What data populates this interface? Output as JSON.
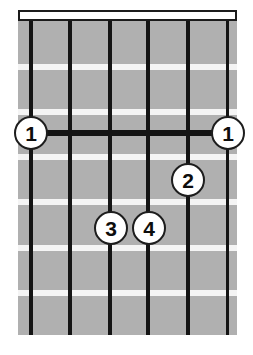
{
  "diagram": {
    "type": "guitar-chord-diagram",
    "orientation": "vertical",
    "string_count": 6,
    "fret_count": 7,
    "colors": {
      "background": "#ffffff",
      "fretboard": "#b0b0b0",
      "fret_line": "#f4f4f4",
      "string_line": "#141414",
      "nut_fill": "#fdfdfd",
      "nut_border": "#1a1a1a",
      "marker_fill": "#ffffff",
      "marker_border": "#1d1d1d",
      "marker_text": "#0d0d0d",
      "barre": "#141414"
    },
    "board": {
      "x": 18,
      "y": 10,
      "width": 219,
      "height": 325
    },
    "nut": {
      "x": 18,
      "y": 10,
      "width": 219,
      "height": 11
    },
    "frets": [
      {
        "index": 1,
        "y": 64,
        "height": 6
      },
      {
        "index": 2,
        "y": 109,
        "height": 6
      },
      {
        "index": 3,
        "y": 154,
        "height": 6
      },
      {
        "index": 4,
        "y": 199,
        "height": 6
      },
      {
        "index": 5,
        "y": 245,
        "height": 6
      },
      {
        "index": 6,
        "y": 290,
        "height": 6
      }
    ],
    "strings": [
      {
        "index": 1,
        "name": "low-E",
        "x": 31,
        "width": 4
      },
      {
        "index": 2,
        "name": "A",
        "x": 70,
        "width": 4
      },
      {
        "index": 3,
        "name": "D",
        "x": 110,
        "width": 4
      },
      {
        "index": 4,
        "name": "G",
        "x": 148,
        "width": 4
      },
      {
        "index": 5,
        "name": "B",
        "x": 188,
        "width": 4
      },
      {
        "index": 6,
        "name": "high-E",
        "x": 227,
        "width": 3
      }
    ],
    "barres": [
      {
        "fret": 3,
        "from_string": 1,
        "to_string": 6,
        "x": 29,
        "y": 130,
        "width": 200,
        "height": 6
      }
    ],
    "markers": [
      {
        "id": "marker-1-left",
        "finger": "1",
        "string": 1,
        "fret": 3,
        "cx": 31,
        "cy": 133,
        "d": 34
      },
      {
        "id": "marker-1-right",
        "finger": "1",
        "string": 6,
        "fret": 3,
        "cx": 228,
        "cy": 133,
        "d": 34
      },
      {
        "id": "marker-2",
        "finger": "2",
        "string": 5,
        "fret": 4,
        "cx": 188,
        "cy": 180,
        "d": 34
      },
      {
        "id": "marker-3",
        "finger": "3",
        "string": 3,
        "fret": 5,
        "cx": 111,
        "cy": 228,
        "d": 34
      },
      {
        "id": "marker-4",
        "finger": "4",
        "string": 4,
        "fret": 5,
        "cx": 149,
        "cy": 228,
        "d": 34
      }
    ]
  }
}
